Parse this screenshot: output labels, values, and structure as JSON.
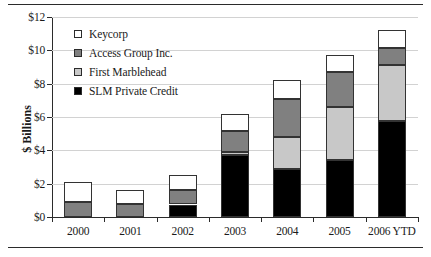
{
  "chart_data": {
    "type": "bar",
    "stacked": true,
    "title": "",
    "xlabel": "",
    "ylabel": "$ Billions",
    "ylim": [
      0,
      12
    ],
    "ytick_values": [
      0,
      2,
      4,
      6,
      8,
      10,
      12
    ],
    "ytick_labels": [
      "$0",
      "$2",
      "$4",
      "$6",
      "$8",
      "$10",
      "$12"
    ],
    "grid": true,
    "legend_position": "upper-left-inside",
    "categories": [
      "2000",
      "2001",
      "2002",
      "2003",
      "2004",
      "2005",
      "2006 YTD"
    ],
    "series": [
      {
        "name": "SLM Private Credit",
        "color": "#000000",
        "values": [
          0.0,
          0.0,
          0.75,
          3.75,
          2.9,
          3.4,
          5.75
        ]
      },
      {
        "name": "First Marblehead",
        "color": "#c8c8c8",
        "values": [
          0.0,
          0.0,
          0.0,
          0.15,
          1.9,
          3.2,
          3.35
        ]
      },
      {
        "name": "Access Group Inc.",
        "color": "#808080",
        "values": [
          0.9,
          0.8,
          0.85,
          1.25,
          2.3,
          2.1,
          1.05
        ]
      },
      {
        "name": "Keycorp",
        "color": "#ffffff",
        "values": [
          1.2,
          0.85,
          0.9,
          1.05,
          1.15,
          1.0,
          1.05
        ]
      }
    ],
    "totals": [
      2.1,
      1.65,
      2.5,
      6.2,
      8.25,
      9.7,
      11.2
    ]
  },
  "legend": {
    "entries": [
      {
        "label": "Keycorp",
        "color": "#ffffff"
      },
      {
        "label": "Access Group Inc.",
        "color": "#808080"
      },
      {
        "label": "First Marblehead",
        "color": "#c8c8c8"
      },
      {
        "label": "SLM Private Credit",
        "color": "#000000"
      }
    ]
  },
  "colors": {
    "axis": "#2b2b2b",
    "grid": "#d2d2d2",
    "rule": "#2b2b2b",
    "text": "#1a1a1a"
  }
}
